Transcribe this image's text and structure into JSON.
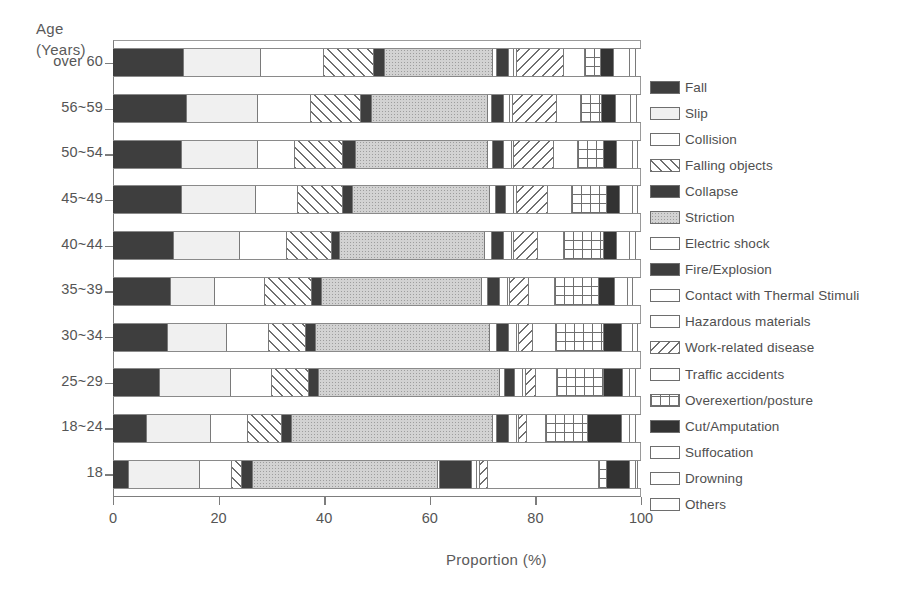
{
  "axis": {
    "y_title_line1": "Age",
    "y_title_line2": "(Years)",
    "x_title": "Proportion (%)"
  },
  "chart_data": {
    "type": "bar",
    "orientation": "horizontal",
    "stacked": true,
    "normalized_to_percent": true,
    "title": "",
    "xlabel": "Proportion (%)",
    "ylabel": "Age (Years)",
    "xlim": [
      0,
      100
    ],
    "xticks": [
      "0",
      "20",
      "40",
      "60",
      "80",
      "100"
    ],
    "xtick_values": [
      0,
      20,
      40,
      60,
      80,
      100
    ],
    "grid": false,
    "legend_position": "right",
    "categories": [
      "over 60",
      "56~59",
      "50~54",
      "45~49",
      "40~44",
      "35~39",
      "30~34",
      "25~29",
      "18~24",
      "18"
    ],
    "series": [
      {
        "name": "Fall",
        "pattern": "solid-dark",
        "values": [
          13.5,
          14.0,
          13.0,
          13.0,
          11.5,
          11.0,
          10.5,
          9.0,
          6.5,
          3.0
        ]
      },
      {
        "name": "Slip",
        "pattern": "light-gray",
        "values": [
          14.5,
          13.5,
          14.5,
          14.0,
          12.5,
          8.5,
          11.0,
          13.5,
          12.0,
          13.5
        ]
      },
      {
        "name": "Collision",
        "pattern": "white",
        "values": [
          12.0,
          10.0,
          7.0,
          8.0,
          9.0,
          9.5,
          8.0,
          8.0,
          7.0,
          6.0
        ]
      },
      {
        "name": "Falling objects",
        "pattern": "diag-forward",
        "values": [
          9.5,
          9.5,
          9.0,
          8.5,
          8.5,
          9.0,
          7.0,
          7.0,
          6.5,
          2.0
        ]
      },
      {
        "name": "Collapse",
        "pattern": "solid-dark",
        "values": [
          2.0,
          2.0,
          2.5,
          2.0,
          1.5,
          2.0,
          2.0,
          2.0,
          2.0,
          2.0
        ]
      },
      {
        "name": "Striction",
        "pattern": "gray-dot",
        "values": [
          20.5,
          22.0,
          25.0,
          26.0,
          27.5,
          30.5,
          33.0,
          34.5,
          38.0,
          35.0
        ]
      },
      {
        "name": "Electric shock",
        "pattern": "white",
        "values": [
          0.8,
          0.8,
          1.0,
          1.0,
          1.2,
          1.2,
          1.2,
          1.0,
          0.8,
          0.5
        ]
      },
      {
        "name": "Fire/Explosion",
        "pattern": "solid-dark",
        "values": [
          2.2,
          2.2,
          2.0,
          2.0,
          2.3,
          2.3,
          2.3,
          2.0,
          2.2,
          6.0
        ]
      },
      {
        "name": "Contact with Thermal Stimuli",
        "pattern": "white",
        "values": [
          1.0,
          1.2,
          1.5,
          1.5,
          1.5,
          1.5,
          1.5,
          1.5,
          1.5,
          1.0
        ]
      },
      {
        "name": "Hazardous materials",
        "pattern": "white",
        "values": [
          0.5,
          0.5,
          0.5,
          0.5,
          0.5,
          0.5,
          0.5,
          0.5,
          0.5,
          0.5
        ]
      },
      {
        "name": "Work-related disease",
        "pattern": "diag-back",
        "values": [
          9.0,
          8.5,
          7.5,
          6.0,
          4.5,
          3.5,
          2.5,
          2.0,
          1.5,
          1.5
        ]
      },
      {
        "name": "Traffic accidents",
        "pattern": "white",
        "values": [
          4.0,
          4.5,
          4.5,
          4.5,
          5.0,
          5.0,
          4.5,
          4.0,
          3.5,
          21.0
        ]
      },
      {
        "name": "Overexertion/posture",
        "pattern": "grid",
        "values": [
          3.0,
          4.0,
          5.0,
          6.5,
          7.5,
          8.5,
          9.0,
          9.0,
          8.0,
          1.5
        ]
      },
      {
        "name": "Cut/Amputation",
        "pattern": "solid-darker",
        "values": [
          2.5,
          2.5,
          2.5,
          2.5,
          2.5,
          3.0,
          3.5,
          3.5,
          6.5,
          4.5
        ]
      },
      {
        "name": "Suffocation",
        "pattern": "white",
        "values": [
          3.0,
          3.0,
          3.0,
          2.5,
          2.5,
          2.5,
          2.0,
          1.5,
          1.5,
          1.0
        ]
      },
      {
        "name": "Drowning",
        "pattern": "white",
        "values": [
          1.0,
          1.0,
          1.0,
          1.0,
          1.0,
          1.0,
          1.0,
          1.0,
          1.0,
          0.5
        ]
      },
      {
        "name": "Others",
        "pattern": "white",
        "values": [
          1.0,
          0.8,
          0.5,
          0.5,
          1.0,
          1.5,
          0.5,
          1.0,
          1.0,
          0.5
        ]
      }
    ]
  },
  "legend": {
    "items": [
      {
        "label": "Fall",
        "pattern": "solid-dark"
      },
      {
        "label": "Slip",
        "pattern": "light-gray"
      },
      {
        "label": "Collision",
        "pattern": "white"
      },
      {
        "label": "Falling objects",
        "pattern": "diag-forward"
      },
      {
        "label": "Collapse",
        "pattern": "solid-dark"
      },
      {
        "label": "Striction",
        "pattern": "gray-dot"
      },
      {
        "label": "Electric shock",
        "pattern": "white"
      },
      {
        "label": "Fire/Explosion",
        "pattern": "solid-dark"
      },
      {
        "label": "Contact with Thermal Stimuli",
        "pattern": "white"
      },
      {
        "label": "Hazardous materials",
        "pattern": "white"
      },
      {
        "label": "Work-related disease",
        "pattern": "diag-back"
      },
      {
        "label": "Traffic accidents",
        "pattern": "white"
      },
      {
        "label": "Overexertion/posture",
        "pattern": "grid"
      },
      {
        "label": "Cut/Amputation",
        "pattern": "solid-darker"
      },
      {
        "label": "Suffocation",
        "pattern": "white"
      },
      {
        "label": "Drowning",
        "pattern": "white"
      },
      {
        "label": "Others",
        "pattern": "white"
      }
    ]
  },
  "colors": {
    "ink": "#4a4a4a",
    "axis": "#7d7d7d",
    "solid_dark": "#3e3e3e",
    "solid_darker": "#333333",
    "light_gray": "#f0f0f0",
    "gray_dot": "#d2d2d2",
    "background": "#ffffff"
  }
}
